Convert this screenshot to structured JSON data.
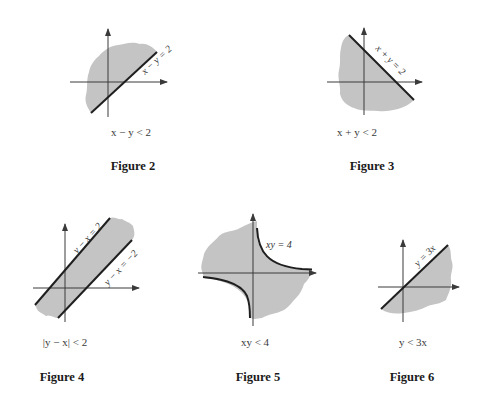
{
  "colors": {
    "shade": "#c4c4c4",
    "line": "#1f1f1f",
    "axis": "#3a3a3a",
    "background": "#ffffff"
  },
  "figures": [
    {
      "id": "figure-2",
      "title": "Figure 2",
      "caption": "x − y < 2",
      "boundary_label": "x − y = 2",
      "boundary": "x - y = 2",
      "region": "x - y < 2"
    },
    {
      "id": "figure-3",
      "title": "Figure 3",
      "caption": "x + y < 2",
      "boundary_label": "x + y = 2",
      "boundary": "x + y = 2",
      "region": "x + y < 2"
    },
    {
      "id": "figure-4",
      "title": "Figure 4",
      "caption": "|y − x| < 2",
      "boundary_labels": [
        "y − x = 2",
        "y − x = −2"
      ],
      "boundary": [
        "y - x = 2",
        "y - x = -2"
      ],
      "region": "|y - x| < 2"
    },
    {
      "id": "figure-5",
      "title": "Figure 5",
      "caption": "xy < 4",
      "boundary_label": "xy = 4",
      "boundary": "xy = 4",
      "region": "xy < 4"
    },
    {
      "id": "figure-6",
      "title": "Figure 6",
      "caption": "y < 3x",
      "boundary_label": "y = 3x",
      "boundary": "y = 3x",
      "region": "y < 3x"
    }
  ]
}
